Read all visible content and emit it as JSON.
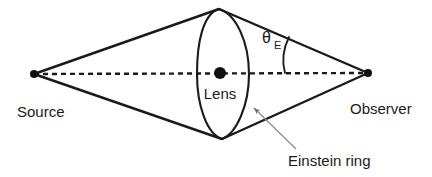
{
  "figure": {
    "type": "diagram",
    "background_color": "#ffffff",
    "line_color": "#1a1a1a",
    "leader_color": "#8c8c8c"
  },
  "labels": {
    "source": "Source",
    "lens": "Lens",
    "observer": "Observer",
    "einstein_ring": "Einstein ring",
    "theta_symbol": "θ",
    "theta_subscript": "E"
  },
  "nodes": {
    "source_point": {
      "x": 34,
      "y": 74,
      "r": 4
    },
    "lens_point": {
      "x": 220,
      "y": 73,
      "r": 6
    },
    "observer_point": {
      "x": 368,
      "y": 73,
      "r": 4
    }
  },
  "geometry": {
    "optical_axis": {
      "x1": 34,
      "y1": 74,
      "x2": 368,
      "y2": 73,
      "style": "dashed"
    },
    "ring_top": {
      "x": 219,
      "y": 9
    },
    "ring_bottom": {
      "x": 222,
      "y": 139
    },
    "ring_left": {
      "x": 197,
      "y": 74
    },
    "ring_right": {
      "x": 249,
      "y": 74
    },
    "angle_arc": {
      "from_x": 289,
      "from_y": 37,
      "to_x": 285,
      "to_y": 73
    }
  }
}
